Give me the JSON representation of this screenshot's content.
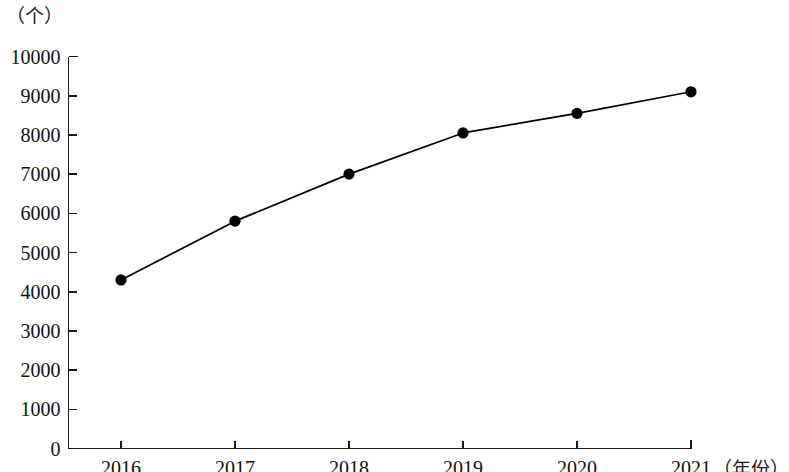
{
  "chart_data": {
    "type": "line",
    "title": "",
    "subtitle": "",
    "xlabel": "（年份）",
    "ylabel": "（个）",
    "categories": [
      "2016",
      "2017",
      "2018",
      "2019",
      "2020",
      "2021"
    ],
    "x": [
      2016,
      2017,
      2018,
      2019,
      2020,
      2021
    ],
    "values": [
      4300,
      5800,
      7000,
      8050,
      8550,
      9100
    ],
    "series": [
      {
        "name": "",
        "values": [
          4300,
          5800,
          7000,
          8050,
          8550,
          9100
        ]
      }
    ],
    "ylim": [
      0,
      10000
    ],
    "ytick_labels": [
      "0",
      "1000",
      "2000",
      "3000",
      "4000",
      "5000",
      "6000",
      "7000",
      "8000",
      "9000",
      "10000"
    ],
    "yticks": [
      0,
      1000,
      2000,
      3000,
      4000,
      5000,
      6000,
      7000,
      8000,
      9000,
      10000
    ],
    "xtick_labels": [
      "2016",
      "2017",
      "2018",
      "2019",
      "2020",
      "2021"
    ],
    "grid": false,
    "legend": false,
    "legend_position": "none",
    "line_color": "#000000",
    "marker_color": "#000000",
    "marker": "circle",
    "background_color": "#ffffff",
    "axis_color": "#1a1a1a",
    "annotations": []
  },
  "axis": {
    "y_unit_text": "（个）",
    "x_unit_text": "（年份）"
  }
}
